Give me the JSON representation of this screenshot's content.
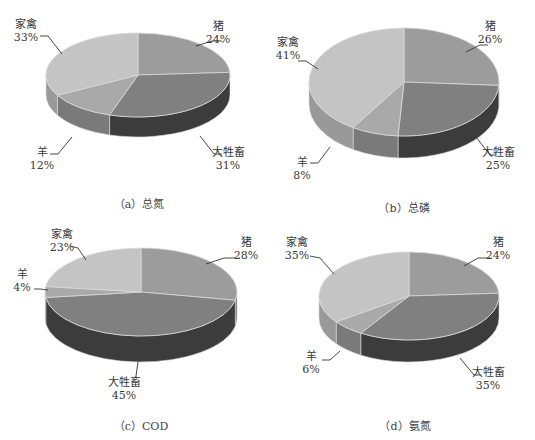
{
  "chart_data": [
    {
      "type": "pie",
      "id": "a",
      "title": "（a）总氮",
      "categories": [
        "猪",
        "大牲畜",
        "羊",
        "家禽"
      ],
      "values": [
        24,
        31,
        12,
        33
      ],
      "labels": [
        "24%",
        "31%",
        "12%",
        "33%"
      ],
      "geometry": {
        "cx": 138,
        "cy": 75,
        "rx": 92,
        "ry": 42,
        "depth": 20
      },
      "label_pos": [
        {
          "x": 218,
          "y": 20,
          "lx1": 196,
          "ly1": 46,
          "lx2": 212,
          "ly2": 41,
          "lx3": 222,
          "ly3": 41
        },
        {
          "x": 228,
          "y": 146,
          "lx1": 200,
          "ly1": 136,
          "lx2": 214,
          "ly2": 154,
          "lx3": 222,
          "ly3": 154
        },
        {
          "x": 42,
          "y": 146,
          "lx1": 72,
          "ly1": 137,
          "lx2": 58,
          "ly2": 154,
          "lx3": 50,
          "ly3": 154
        },
        {
          "x": 26,
          "y": 18,
          "lx1": 62,
          "ly1": 54,
          "lx2": 48,
          "ly2": 36,
          "lx3": 40,
          "ly3": 36
        }
      ],
      "caption_pos": {
        "x": 139,
        "y": 195
      }
    },
    {
      "type": "pie",
      "id": "b",
      "title": "（b）总磷",
      "categories": [
        "猪",
        "大牲畜",
        "羊",
        "家禽"
      ],
      "values": [
        26,
        25,
        8,
        41
      ],
      "labels": [
        "26%",
        "25%",
        "8%",
        "41%"
      ],
      "geometry": {
        "cx": 404,
        "cy": 82,
        "rx": 95,
        "ry": 54,
        "depth": 22
      },
      "label_pos": [
        {
          "x": 490,
          "y": 20,
          "lx1": 466,
          "ly1": 52,
          "lx2": 480,
          "ly2": 45,
          "lx3": 488,
          "ly3": 45
        },
        {
          "x": 498,
          "y": 146,
          "lx1": 476,
          "ly1": 137,
          "lx2": 490,
          "ly2": 155,
          "lx3": 496,
          "ly3": 155
        },
        {
          "x": 302,
          "y": 156,
          "lx1": 330,
          "ly1": 147,
          "lx2": 318,
          "ly2": 163,
          "lx3": 310,
          "ly3": 163
        },
        {
          "x": 288,
          "y": 36,
          "lx1": 318,
          "ly1": 69,
          "lx2": 306,
          "ly2": 61,
          "lx3": 298,
          "ly3": 61
        }
      ],
      "caption_pos": {
        "x": 404,
        "y": 199
      }
    },
    {
      "type": "pie",
      "id": "c",
      "title": "（c）COD",
      "categories": [
        "猪",
        "大牲畜",
        "羊",
        "家禽"
      ],
      "values": [
        28,
        45,
        4,
        23
      ],
      "labels": [
        "28%",
        "45%",
        "4%",
        "23%"
      ],
      "geometry": {
        "cx": 141,
        "cy": 292,
        "rx": 96,
        "ry": 44,
        "depth": 26
      },
      "label_pos": [
        {
          "x": 246,
          "y": 236,
          "lx1": 206,
          "ly1": 264,
          "lx2": 224,
          "ly2": 258,
          "lx3": 236,
          "ly3": 258
        },
        {
          "x": 124,
          "y": 376,
          "lx1": 138,
          "ly1": 362,
          "lx2": 136,
          "ly2": 376,
          "lx3": 136,
          "ly3": 378
        },
        {
          "x": 22,
          "y": 268,
          "lx1": 48,
          "ly1": 290,
          "lx2": 40,
          "ly2": 289,
          "lx3": 34,
          "ly3": 289
        },
        {
          "x": 62,
          "y": 228,
          "lx1": 86,
          "ly1": 260,
          "lx2": 78,
          "ly2": 248,
          "lx3": 70,
          "ly3": 246
        }
      ],
      "caption_pos": {
        "x": 141,
        "y": 417
      }
    },
    {
      "type": "pie",
      "id": "d",
      "title": "（d）氨氮",
      "categories": [
        "猪",
        "大牲畜",
        "羊",
        "家禽"
      ],
      "values": [
        24,
        35,
        6,
        35
      ],
      "labels": [
        "24%",
        "35%",
        "6%",
        "35%"
      ],
      "geometry": {
        "cx": 409,
        "cy": 296,
        "rx": 90,
        "ry": 44,
        "depth": 22
      },
      "label_pos": [
        {
          "x": 498,
          "y": 236,
          "lx1": 464,
          "ly1": 266,
          "lx2": 478,
          "ly2": 258,
          "lx3": 490,
          "ly3": 258
        },
        {
          "x": 488,
          "y": 366,
          "lx1": 460,
          "ly1": 358,
          "lx2": 474,
          "ly2": 375,
          "lx3": 480,
          "ly3": 375
        },
        {
          "x": 311,
          "y": 350,
          "lx1": 340,
          "ly1": 351,
          "lx2": 330,
          "ly2": 360,
          "lx3": 322,
          "ly3": 360
        },
        {
          "x": 297,
          "y": 236,
          "lx1": 334,
          "ly1": 274,
          "lx2": 320,
          "ly2": 258,
          "lx3": 310,
          "ly3": 256
        }
      ],
      "caption_pos": {
        "x": 405,
        "y": 417
      }
    }
  ],
  "colors": {
    "top": [
      "#9c9c9c",
      "#808080",
      "#a9a9a9",
      "#c4c4c4"
    ],
    "side": [
      "#6a6a6a",
      "#3c3c3c",
      "#7a7a7a",
      "#999999"
    ],
    "edge": "#d8d8d8",
    "leader": "#333333"
  }
}
